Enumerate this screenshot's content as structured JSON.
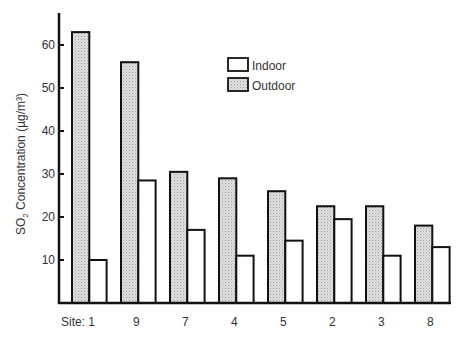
{
  "chart_data": {
    "type": "bar",
    "title": "",
    "xlabel": "Site",
    "ylabel": "SO2 Concentration (µg/m³)",
    "ylabel_parts": {
      "pre": "SO",
      "sub": "2",
      "post": " Concentration (µg/m³)"
    },
    "categories": [
      "1",
      "9",
      "7",
      "4",
      "5",
      "2",
      "3",
      "8"
    ],
    "category_prefix": "Site: ",
    "series": [
      {
        "name": "Outdoor",
        "values": [
          63,
          56,
          30.5,
          29,
          26,
          22.5,
          22.5,
          18
        ],
        "fill": "pattern-stipple",
        "color": "#d4d4d4"
      },
      {
        "name": "Indoor",
        "values": [
          10,
          28.5,
          17,
          11,
          14.5,
          19.5,
          11,
          13
        ],
        "fill": "white",
        "color": "#ffffff"
      }
    ],
    "yticks": [
      10,
      20,
      30,
      40,
      50,
      60
    ],
    "ylim": [
      0,
      67
    ],
    "grid": false,
    "legend": {
      "position": "upper-center",
      "entries": [
        "Indoor",
        "Outdoor"
      ]
    }
  }
}
